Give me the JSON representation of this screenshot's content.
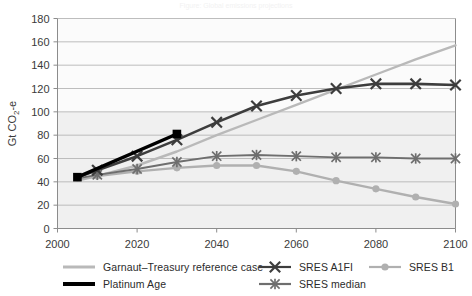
{
  "title": "Figure: Global emissions projections",
  "axes": {
    "ylabel": "Gt CO2-e",
    "ylabel_main": "Gt CO",
    "ylabel_sub": "2",
    "ylabel_tail": "-e",
    "xlabel": "",
    "yticks": [
      "0",
      "20",
      "40",
      "60",
      "80",
      "100",
      "120",
      "140",
      "160",
      "180"
    ],
    "xticks": [
      "2000",
      "2020",
      "2040",
      "2060",
      "2080",
      "2100"
    ]
  },
  "colors": {
    "garnaut": "#b9b9b9",
    "platinum": "#000000",
    "a1fi": "#4d4d4d",
    "b1": "#b0b0b0",
    "median": "#6e6e6e",
    "gridline": "#b5b5b5",
    "axis": "#8c8c8c",
    "plot_band": "#f0f0f0",
    "text": "#2b2b2b"
  },
  "legend": {
    "items": [
      {
        "key": "garnaut",
        "label": "Garnaut–Treasury reference case",
        "marker": "line",
        "color": "#b9b9b9",
        "width": 3
      },
      {
        "key": "platinum",
        "label": "Platinum Age",
        "marker": "line",
        "color": "#000000",
        "width": 4
      },
      {
        "key": "a1fi",
        "label": "SRES A1FI",
        "marker": "cross",
        "color": "#3d3d3d",
        "width": 3
      },
      {
        "key": "b1",
        "label": "SRES B1",
        "marker": "circle",
        "color": "#b0b0b0",
        "width": 3
      },
      {
        "key": "median",
        "label": "SRES median",
        "marker": "star",
        "color": "#6e6e6e",
        "width": 3
      }
    ]
  },
  "chart_data": {
    "type": "line",
    "title": "",
    "xlabel": "",
    "ylabel": "Gt CO2-e",
    "xlim": [
      2000,
      2100
    ],
    "ylim": [
      0,
      180
    ],
    "ytick_step": 20,
    "xtick_step": 20,
    "grid": "horizontal",
    "legend_position": "bottom",
    "series": [
      {
        "name": "Garnaut–Treasury reference case",
        "color": "#b9b9b9",
        "marker": "none",
        "x": [
          2005,
          2010,
          2020,
          2030,
          2040,
          2050,
          2060,
          2070,
          2080,
          2090,
          2100
        ],
        "values": [
          41,
          45,
          54,
          66,
          80,
          93,
          106,
          119,
          132,
          145,
          157
        ]
      },
      {
        "name": "Platinum Age",
        "color": "#000000",
        "marker": "square",
        "x": [
          2005,
          2030
        ],
        "values": [
          44,
          81
        ]
      },
      {
        "name": "SRES A1FI",
        "color": "#3d3d3d",
        "marker": "cross",
        "x": [
          2005,
          2010,
          2020,
          2030,
          2040,
          2050,
          2060,
          2070,
          2080,
          2090,
          2100
        ],
        "values": [
          44,
          50,
          62,
          76,
          91,
          105,
          114,
          120,
          124,
          124,
          123
        ]
      },
      {
        "name": "SRES median",
        "color": "#6e6e6e",
        "marker": "star",
        "x": [
          2005,
          2010,
          2020,
          2030,
          2040,
          2050,
          2060,
          2070,
          2080,
          2090,
          2100
        ],
        "values": [
          43,
          46,
          51,
          57,
          62,
          63,
          62,
          61,
          61,
          60,
          60
        ]
      },
      {
        "name": "SRES B1",
        "color": "#b0b0b0",
        "marker": "circle",
        "x": [
          2005,
          2010,
          2020,
          2030,
          2040,
          2050,
          2060,
          2070,
          2080,
          2090,
          2100
        ],
        "values": [
          42,
          45,
          49,
          52,
          54,
          54,
          49,
          41,
          34,
          27,
          21
        ]
      }
    ]
  }
}
